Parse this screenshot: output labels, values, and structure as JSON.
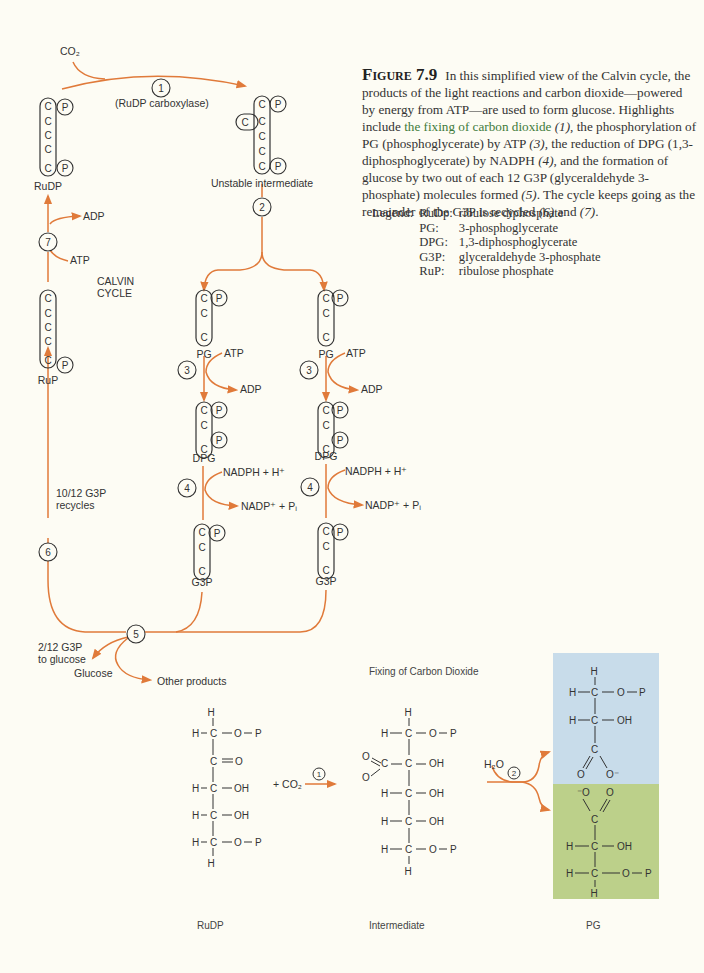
{
  "figure": {
    "number_label": "Figure 7.9",
    "caption_parts": {
      "p1": "In this simplified view of the Calvin cycle, the products of the light reactions and carbon dioxide—powered by energy from ATP—are used to form glucose. Highlights include ",
      "highlight": "the fixing of carbon dioxide",
      "step1": "(1)",
      "p2": ", the phosphorylation of PG (phosphoglycerate) by ATP ",
      "step3": "(3)",
      "p3": ", the reduction of DPG (1,3-diphosphoglycerate) by NADPH ",
      "step4": "(4)",
      "p4": ", and the formation of glucose by two out of each 12 G3P (glyceraldehyde 3-phosphate) molecules formed ",
      "step5": "(5)",
      "p5": ". The cycle keeps going as the remainder of the G3P is recycled ",
      "step6": "(6)",
      "p6": " and ",
      "step7": "(7)",
      "p7": "."
    },
    "legend": {
      "title": "Legend:",
      "entries": [
        {
          "abbr": "RuDp:",
          "meaning": "ribulose diphosphate"
        },
        {
          "abbr": "PG:",
          "meaning": "3-phosphoglycerate"
        },
        {
          "abbr": "DPG:",
          "meaning": "1,3-diphosphoglycerate"
        },
        {
          "abbr": "G3P:",
          "meaning": "glyceraldehyde 3-phosphate"
        },
        {
          "abbr": "RuP:",
          "meaning": "ribulose phosphate"
        }
      ]
    }
  },
  "cycle": {
    "title_line1": "CALVIN",
    "title_line2": "CYCLE",
    "co2": "CO₂",
    "enzyme": "(RuDP carboxylase)",
    "steps": [
      "1",
      "2",
      "3",
      "4",
      "5",
      "6",
      "7"
    ],
    "molecules": {
      "rudp": "RuDP",
      "unstable": "Unstable intermediate",
      "pg": "PG",
      "dpg": "DPG",
      "g3p": "G3P",
      "rup": "RuP"
    },
    "atoms": {
      "c": "C",
      "p": "P"
    },
    "cofactors": {
      "atp": "ATP",
      "adp": "ADP",
      "nadph": "NADPH + H⁺",
      "nadp": "NADP⁺ + Pᵢ"
    },
    "recycle_line1": "10/12 G3P",
    "recycle_line2": "recycles",
    "glucose_line1": "2/12 G3P",
    "glucose_line2": "to glucose",
    "glucose": "Glucose",
    "other_products": "Other products"
  },
  "fixing": {
    "title": "Fixing of Carbon Dioxide",
    "plus_co2": "+ CO₂",
    "h2o": "H₂O",
    "labels": {
      "rudp": "RuDP",
      "intermediate": "Intermediate",
      "pg": "PG"
    }
  },
  "colors": {
    "arrow": "#e07a3a",
    "background": "#fdfcf4",
    "pg_top_box": "#c8dcea",
    "pg_bottom_box": "#bcd08a",
    "highlight_text": "#3d7a3a"
  }
}
